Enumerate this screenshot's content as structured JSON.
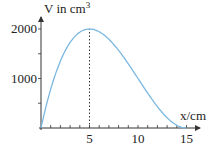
{
  "chart_data": {
    "type": "line",
    "title": "",
    "xlabel": "x/cm",
    "ylabel": "V in cm³",
    "ylabel_base": "V in cm",
    "ylabel_sup": "3",
    "xlim": [
      0,
      15.5
    ],
    "ylim": [
      0,
      2200
    ],
    "x_ticks": [
      5,
      10,
      15
    ],
    "x_tick_labels": [
      "5",
      "10",
      "15"
    ],
    "y_ticks": [
      1000,
      2000
    ],
    "y_tick_labels": [
      "1000",
      "2000"
    ],
    "grid": false,
    "legend": null,
    "series": [
      {
        "name": "V(x) = x(30 - 2x)^2",
        "x": [
          0,
          1,
          2,
          3,
          4,
          5,
          6,
          7,
          8,
          9,
          10,
          11,
          12,
          13,
          14,
          15
        ],
        "values": [
          0,
          784,
          1352,
          1728,
          1936,
          2000,
          1944,
          1792,
          1568,
          1296,
          1000,
          704,
          432,
          208,
          56,
          0
        ]
      }
    ],
    "annotations": [
      {
        "type": "dashed-vertical-line",
        "x": 5,
        "from": 0,
        "to": 2000,
        "label": "maximum at x = 5"
      }
    ],
    "colors": {
      "curve": "#7ab8e0",
      "axis": "#333333",
      "text": "#222222"
    }
  }
}
